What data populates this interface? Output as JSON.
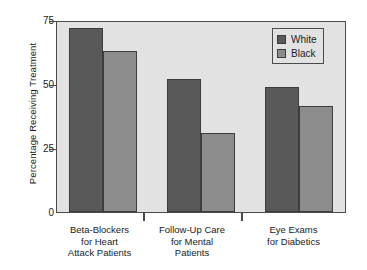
{
  "chart_data": {
    "type": "bar",
    "title": "",
    "subtitle": "",
    "xlabel": "",
    "ylabel": "Percentage Receiving Treatment",
    "ylim": [
      0,
      75
    ],
    "yticks": [
      0,
      25,
      50,
      75
    ],
    "ytick_labels": [
      "0",
      "25",
      "50",
      "75"
    ],
    "grid": false,
    "legend_position": "top-right",
    "categories": [
      "Beta-Blockers for Heart Attack Patients",
      "Follow-Up Care for Mental Patients",
      "Eye Exams for Diabetics"
    ],
    "category_lines": [
      [
        "Beta-Blockers",
        "for Heart",
        "Attack Patients"
      ],
      [
        "Follow-Up Care",
        "for Mental",
        "Patients"
      ],
      [
        "Eye Exams",
        "for Diabetics"
      ]
    ],
    "series": [
      {
        "name": "White",
        "color": "#595959",
        "values": [
          72,
          52,
          49
        ]
      },
      {
        "name": "Black",
        "color": "#8c8c8c",
        "values": [
          63,
          31,
          41.5
        ]
      }
    ]
  },
  "legend": {
    "items": [
      {
        "label": "White"
      },
      {
        "label": "Black"
      }
    ]
  },
  "axis": {
    "y_title": "Percentage Receiving Treatment",
    "y_labels": [
      "75",
      "50",
      "25",
      "0"
    ]
  },
  "colors": {
    "series_white": "#595959",
    "series_black": "#8c8c8c",
    "plot_background": "#e2e2e2",
    "frame": "#4a4a4a",
    "page_background": "#ffffff",
    "text": "#1a1a1a"
  }
}
